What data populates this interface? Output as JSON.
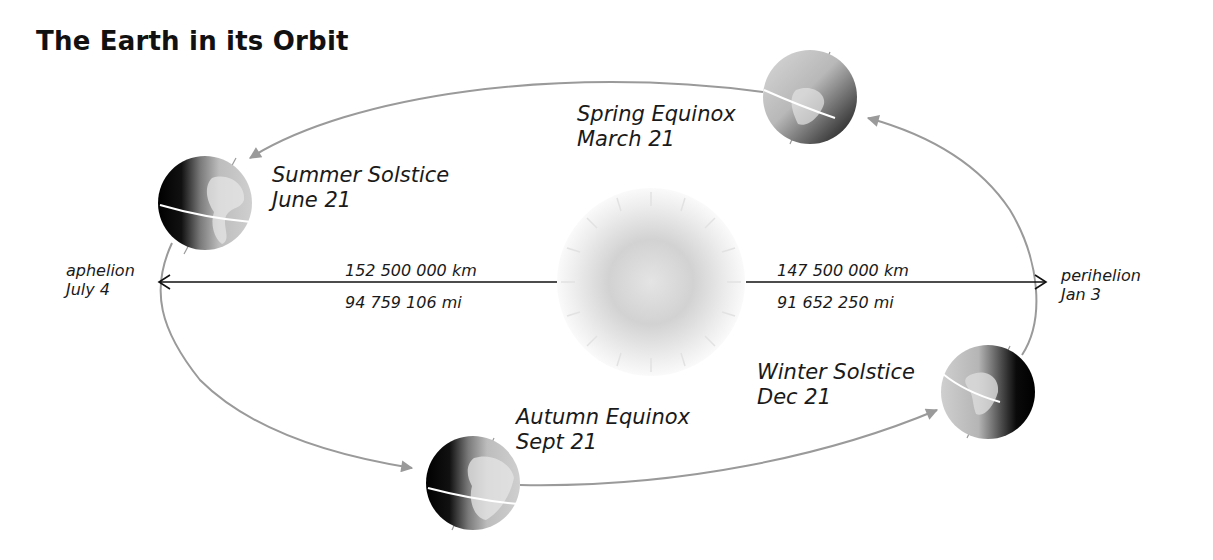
{
  "title": "The Earth in its Orbit",
  "colors": {
    "orbit": "#9a9a9a",
    "distance_arrow": "#111111",
    "text": "#1a1a1a",
    "sun_center": "#d4d4d4",
    "sun_edge": "#f4f4f4"
  },
  "positions": [
    {
      "id": "spring",
      "name": "Spring Equinox",
      "date": "March 21"
    },
    {
      "id": "summer",
      "name": "Summer Solstice",
      "date": "June 21"
    },
    {
      "id": "autumn",
      "name": "Autumn Equinox",
      "date": "Sept 21"
    },
    {
      "id": "winter",
      "name": "Winter Solstice",
      "date": "Dec 21"
    }
  ],
  "aphelion": {
    "label": "aphelion",
    "date": "July 4",
    "distance_km": "152 500 000 km",
    "distance_mi": "94 759 106 mi"
  },
  "perihelion": {
    "label": "perihelion",
    "date": "Jan 3",
    "distance_km": "147 500 000 km",
    "distance_mi": "91 652 250 mi"
  },
  "icons": {
    "sun": "sun-icon",
    "earth": "earth-globe-icon",
    "orbit": "orbit-path",
    "arrow": "arrowhead-icon"
  }
}
